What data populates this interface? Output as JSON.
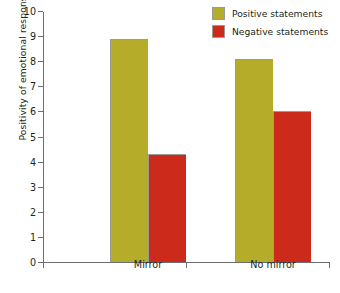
{
  "chart_data": {
    "type": "bar",
    "title": "",
    "xlabel": "",
    "ylabel": "Positivity of emotional response",
    "categories": [
      "Mirror",
      "No mirror"
    ],
    "series": [
      {
        "name": "Positive statements",
        "values": [
          8.9,
          8.1
        ],
        "color": "#b5ad2a"
      },
      {
        "name": "Negative statements",
        "values": [
          4.3,
          6.0
        ],
        "color": "#cc2a1a"
      }
    ],
    "ylim": [
      0,
      10
    ],
    "y_ticks": [
      0,
      1,
      2,
      3,
      4,
      5,
      6,
      7,
      8,
      9,
      10
    ],
    "y_tick_labels": [
      "0",
      "1",
      "2",
      "3",
      "4",
      "5",
      "6",
      "7",
      "8",
      "9",
      "10"
    ],
    "grid": false,
    "legend_position": "top-right",
    "legend": [
      "Positive statements",
      "Negative statements"
    ]
  }
}
